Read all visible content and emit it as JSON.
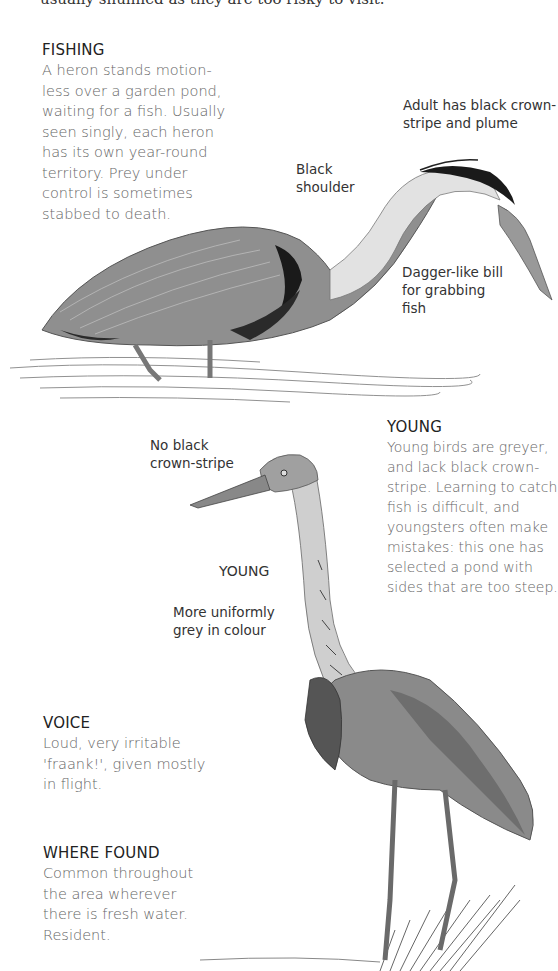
{
  "page": {
    "cutoff_line": "usually shunned as they are too risky to visit."
  },
  "fishing": {
    "heading": "FISHING",
    "lines": [
      "A heron stands motion-",
      "less over a garden pond,",
      "waiting for a fish. Usually",
      "seen singly, each heron",
      "has its own year-round",
      "territory. Prey under",
      "control is sometimes",
      "stabbed to death."
    ]
  },
  "adult_labels": {
    "crown": [
      "Adult has black crown-",
      "stripe and plume"
    ],
    "shoulder": [
      "Black",
      "shoulder"
    ],
    "bill": [
      "Dagger-like bill",
      "for grabbing",
      "fish"
    ]
  },
  "young_section": {
    "heading": "YOUNG",
    "lines": [
      "Young birds are greyer,",
      "and lack black crown-",
      "stripe. Learning to catch",
      "fish is difficult, and",
      "youngsters often make",
      "mistakes: this one has",
      "selected a pond with",
      "sides that are too steep."
    ]
  },
  "young_labels": {
    "no_stripe": [
      "No black",
      "crown-stripe"
    ],
    "young_tag": "YOUNG",
    "uniform": [
      "More uniformly",
      "grey in colour"
    ]
  },
  "voice": {
    "heading": "VOICE",
    "lines": [
      "Loud, very irritable",
      "'fraank!', given mostly",
      "in flight."
    ]
  },
  "where_found": {
    "heading": "WHERE FOUND",
    "lines": [
      "Common throughout",
      "the area wherever",
      "there is fresh water.",
      "Resident."
    ]
  },
  "illustrations": {
    "adult": "adult-heron-fishing",
    "young": "young-heron-standing",
    "colors": {
      "body": "#8c8c8c",
      "dark": "#1e1e1e",
      "light": "#e8e8e8",
      "mid": "#b0b0b0"
    }
  }
}
